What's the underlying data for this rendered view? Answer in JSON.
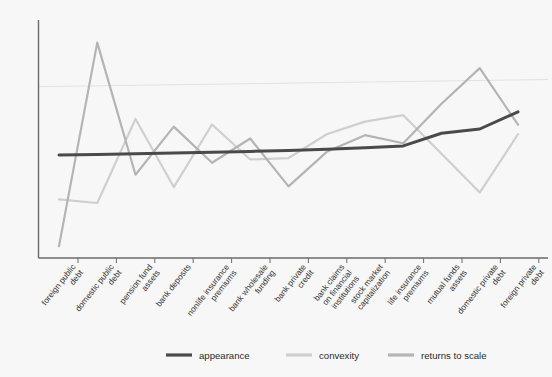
{
  "chart_data": {
    "type": "line",
    "title": "",
    "subtitle": "",
    "xlabel": "",
    "ylabel": "",
    "grid": true,
    "legend_position": "bottom",
    "categories": [
      "foreign public debt",
      "domestic public debt",
      "pension fund assets",
      "bank deposits",
      "nonlife insurance premiums",
      "bank wholesale funding",
      "bank private credit",
      "bank claims on financial institutions",
      "stock market capitalization",
      "life insurance premiums",
      "mutual funds assets",
      "domestic private debt",
      "foreign private debt"
    ],
    "ylim": [
      0,
      100
    ],
    "yticks": [],
    "series": [
      {
        "name": "appearance",
        "color": "#4a4a4a",
        "values": [
          43.3,
          43.5,
          43.8,
          44.1,
          44.4,
          44.8,
          45.2,
          45.7,
          46.3,
          47.1,
          52.4,
          54.2,
          61.4
        ]
      },
      {
        "name": "convexity",
        "color": "#cfcfcf",
        "values": [
          24.6,
          23.1,
          58.4,
          29.8,
          56.1,
          41.4,
          42.0,
          52.0,
          57.3,
          60.0,
          43.8,
          27.5,
          52.0
        ]
      },
      {
        "name": "returns to scale",
        "color": "#b4b4b4",
        "values": [
          5.0,
          90.5,
          35.0,
          55.2,
          40.0,
          50.2,
          30.1,
          44.6,
          51.6,
          48.2,
          64.8,
          79.8,
          56.0
        ]
      }
    ],
    "legend": [
      {
        "label": "appearance",
        "color": "#4a4a4a"
      },
      {
        "label": "convexity",
        "color": "#cfcfcf"
      },
      {
        "label": "returns to scale",
        "color": "#b4b4b4"
      }
    ],
    "reference_line": {
      "name": "trend-reference-line",
      "color": "#e4e4e4",
      "y_left": 72.0,
      "y_right": 75.0
    }
  }
}
